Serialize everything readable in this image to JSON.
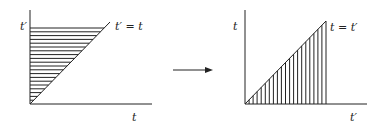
{
  "diagram": {
    "type": "integration-region-transformation",
    "left_panel": {
      "y_axis_label": "t′",
      "x_axis_label": "t",
      "line_label": "t′ = t",
      "hatch_direction": "horizontal",
      "hatch_count": 20
    },
    "arrow": {
      "direction": "right"
    },
    "right_panel": {
      "y_axis_label": "t",
      "x_axis_label": "t′",
      "line_label": "t = t′",
      "hatch_direction": "vertical",
      "hatch_count": 20
    },
    "colors": {
      "ink": "#222222",
      "background": "#ffffff"
    }
  }
}
